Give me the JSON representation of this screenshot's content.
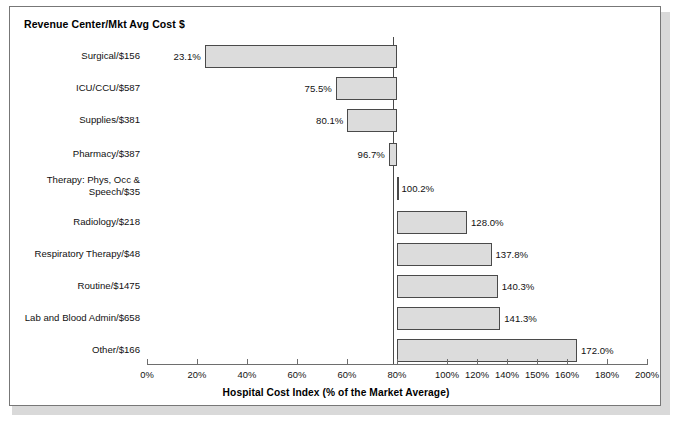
{
  "panel": {
    "title": "Revenue Center/Mkt Avg Cost $"
  },
  "chart_data": {
    "type": "bar",
    "orientation": "horizontal",
    "title": "Revenue Center/Mkt Avg Cost $",
    "xlabel": "Hospital Cost Index (% of the Market Average)",
    "ylabel": "",
    "xlim": [
      0,
      200
    ],
    "baseline": 100,
    "grid": false,
    "legend": null,
    "bar_fill_color": "#dcdcdc",
    "bar_border_color": "#4a4a4a",
    "categories": [
      "Surgical/$156",
      "ICU/CCU/$587",
      "Supplies/$381",
      "Pharmacy/$387",
      "Therapy: Phys, Occ &\nSpeech/$35",
      "Radiology/$218",
      "Respiratory Therapy/$48",
      "Routine/$1475",
      "Lab and Blood Admin/$658",
      "Other/$166"
    ],
    "values": [
      23.1,
      75.5,
      80.1,
      96.7,
      100.2,
      128.0,
      137.8,
      140.3,
      141.3,
      172.0
    ],
    "data_labels": [
      "23.1%",
      "75.5%",
      "80.1%",
      "96.7%",
      "100.2%",
      "128.0%",
      "137.8%",
      "140.3%",
      "141.3%",
      "172.0%"
    ],
    "xticks": [
      0,
      20,
      40,
      60,
      80,
      100,
      120,
      140,
      150,
      160,
      180,
      200
    ],
    "xtick_labels": [
      "0%",
      "20%",
      "40%",
      "60%",
      "60%",
      "80%",
      "100%",
      "120%",
      "140%",
      "150%",
      "160%",
      "180%",
      "200%"
    ]
  },
  "axis": {
    "ticks": [
      {
        "label": "0%",
        "pos": 0
      },
      {
        "label": "20%",
        "pos": 20
      },
      {
        "label": "40%",
        "pos": 40
      },
      {
        "label": "60%",
        "pos": 60
      },
      {
        "label": "60%",
        "pos": 80
      },
      {
        "label": "80%",
        "pos": 100
      },
      {
        "label": "100%",
        "pos": 120
      },
      {
        "label": "120%",
        "pos": 132
      },
      {
        "label": "140%",
        "pos": 144
      },
      {
        "label": "150%",
        "pos": 156
      },
      {
        "label": "160%",
        "pos": 168
      },
      {
        "label": "180%",
        "pos": 184
      },
      {
        "label": "200%",
        "pos": 200
      }
    ],
    "title": "Hospital Cost Index (% of the Market Average)"
  }
}
